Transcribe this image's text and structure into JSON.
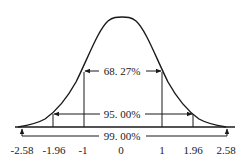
{
  "diagram": {
    "type": "normal-distribution",
    "colors": {
      "stroke": "#1a1a1a",
      "background": "#ffffff"
    },
    "intervals": [
      {
        "label": "68. 27%",
        "from": -1,
        "to": 1
      },
      {
        "label": "95. 00%",
        "from": -1.96,
        "to": 1.96
      },
      {
        "label": "99. 00%",
        "from": -2.58,
        "to": 2.58
      }
    ],
    "ticks": [
      {
        "value": -2.58,
        "label": "-2.58"
      },
      {
        "value": -1.96,
        "label": "-1.96"
      },
      {
        "value": -1,
        "label": "-1"
      },
      {
        "value": 0,
        "label": "0"
      },
      {
        "value": 1,
        "label": "1"
      },
      {
        "value": 1.96,
        "label": "1.96"
      },
      {
        "value": 2.58,
        "label": "2.58"
      }
    ]
  }
}
